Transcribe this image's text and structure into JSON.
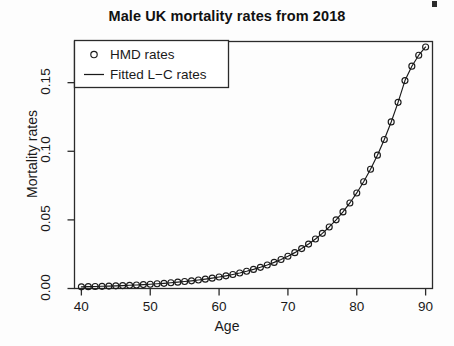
{
  "chart_data": {
    "type": "scatter",
    "title": "Male UK mortality rates from 2018",
    "xlabel": "Age",
    "ylabel": "Mortality rates",
    "xlim": [
      39,
      91
    ],
    "ylim": [
      0.0,
      0.18
    ],
    "xticks": [
      40,
      50,
      60,
      70,
      80,
      90
    ],
    "xtick_labels": [
      "40",
      "50",
      "60",
      "70",
      "80",
      "90"
    ],
    "yticks": [
      0.0,
      0.05,
      0.1,
      0.15
    ],
    "ytick_labels": [
      "0.00",
      "0.05",
      "0.10",
      "0.15"
    ],
    "grid": false,
    "legend_position": "top-left",
    "x": [
      40,
      41,
      42,
      43,
      44,
      45,
      46,
      47,
      48,
      49,
      50,
      51,
      52,
      53,
      54,
      55,
      56,
      57,
      58,
      59,
      60,
      61,
      62,
      63,
      64,
      65,
      66,
      67,
      68,
      69,
      70,
      71,
      72,
      73,
      74,
      75,
      76,
      77,
      78,
      79,
      80,
      81,
      82,
      83,
      84,
      85,
      86,
      87,
      88,
      89,
      90
    ],
    "series": [
      {
        "name": "HMD rates",
        "marker": "circle",
        "color": "#1a1a1a",
        "values": [
          0.00122,
          0.00133,
          0.00146,
          0.0016,
          0.00176,
          0.00193,
          0.00212,
          0.00233,
          0.00257,
          0.00283,
          0.00311,
          0.00343,
          0.00378,
          0.00417,
          0.0046,
          0.00507,
          0.0056,
          0.00618,
          0.00683,
          0.00755,
          0.00835,
          0.00924,
          0.01023,
          0.01133,
          0.01256,
          0.01392,
          0.01544,
          0.01714,
          0.01903,
          0.02114,
          0.0235,
          0.02614,
          0.02909,
          0.03239,
          0.03608,
          0.04021,
          0.04484,
          0.05002,
          0.05583,
          0.06234,
          0.06963,
          0.0778,
          0.08694,
          0.09717,
          0.1086,
          0.12138,
          0.13564,
          0.15154,
          0.162,
          0.17,
          0.176
        ]
      },
      {
        "name": "Fitted L-C rates",
        "marker": "line",
        "color": "#1a1a1a",
        "values": [
          0.00122,
          0.00133,
          0.00146,
          0.0016,
          0.00176,
          0.00193,
          0.00212,
          0.00233,
          0.00257,
          0.00283,
          0.00311,
          0.00343,
          0.00378,
          0.00417,
          0.0046,
          0.00507,
          0.0056,
          0.00618,
          0.00683,
          0.00755,
          0.00835,
          0.00924,
          0.01023,
          0.01133,
          0.01256,
          0.01392,
          0.01544,
          0.01714,
          0.01903,
          0.02114,
          0.0235,
          0.02614,
          0.02909,
          0.03239,
          0.03608,
          0.04021,
          0.04484,
          0.05002,
          0.05583,
          0.06234,
          0.06963,
          0.0778,
          0.08694,
          0.09717,
          0.1086,
          0.12138,
          0.13564,
          0.15154,
          0.162,
          0.17,
          0.176
        ]
      }
    ]
  },
  "legend": {
    "entries": [
      {
        "label": "HMD rates",
        "marker": "circle"
      },
      {
        "label": "Fitted L−C rates",
        "marker": "line"
      }
    ]
  },
  "colors": {
    "ink": "#1a1a1a",
    "background": "#fdfdfd",
    "axis": "#2b2b2b"
  }
}
